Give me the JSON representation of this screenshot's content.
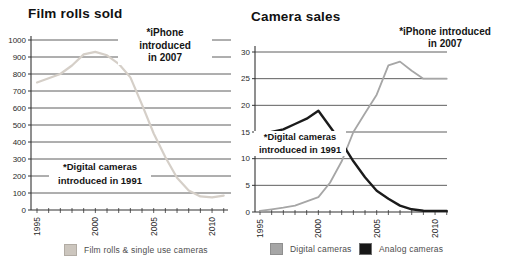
{
  "page": {
    "background": "#ffffff"
  },
  "chart_data": [
    {
      "type": "line",
      "title": "Film rolls sold",
      "x": [
        1995,
        1996,
        1997,
        1998,
        1999,
        2000,
        2001,
        2002,
        2003,
        2004,
        2005,
        2006,
        2007,
        2008,
        2009,
        2010,
        2011
      ],
      "x_tick_labels": [
        "1995",
        "2000",
        "2005",
        "2010"
      ],
      "x_labeled_years": [
        1995,
        2000,
        2005,
        2010
      ],
      "ylim": [
        0,
        1000
      ],
      "y_ticks": [
        0,
        100,
        200,
        300,
        400,
        500,
        600,
        700,
        800,
        900,
        1000
      ],
      "grid": "on",
      "series": [
        {
          "name": "Film rolls & single use cameras",
          "color": "#d5cfc8",
          "width": 2.2,
          "values": [
            750,
            775,
            800,
            850,
            915,
            930,
            910,
            860,
            780,
            620,
            450,
            310,
            190,
            115,
            80,
            75,
            85
          ]
        }
      ],
      "annotations": [
        {
          "lines": [
            "*iPhone",
            "introduced",
            "in 2007"
          ]
        },
        {
          "lines": [
            "*Digital cameras",
            "introduced in 1991"
          ]
        }
      ],
      "legend": [
        {
          "label": "Film rolls & single use cameras",
          "color": "#ccc6be",
          "border": "#b2aca4"
        }
      ],
      "legend_position": "bottom"
    },
    {
      "type": "line",
      "title": "Camera sales",
      "x": [
        1995,
        1996,
        1997,
        1998,
        1999,
        2000,
        2001,
        2002,
        2003,
        2004,
        2005,
        2006,
        2007,
        2008,
        2009,
        2010,
        2011
      ],
      "x_tick_labels": [
        "1995",
        "2000",
        "2005",
        "2010"
      ],
      "x_labeled_years": [
        1995,
        2000,
        2005,
        2010
      ],
      "ylim": [
        0,
        30
      ],
      "y_ticks": [
        0,
        5,
        10,
        15,
        20,
        25,
        30
      ],
      "grid": "on",
      "series": [
        {
          "name": "Digital cameras",
          "color": "#a6a6a6",
          "width": 1.8,
          "values": [
            0.2,
            0.5,
            0.8,
            1.2,
            2,
            2.8,
            5.5,
            9.5,
            15,
            18.5,
            22,
            27.5,
            28.2,
            26.5,
            25,
            25,
            25
          ]
        },
        {
          "name": "Analog cameras",
          "color": "#1b1b1b",
          "width": 2.4,
          "values": [
            14.5,
            15,
            15.5,
            16.5,
            17.5,
            19,
            16,
            13,
            9.5,
            6.5,
            4,
            2.5,
            1.2,
            0.5,
            0.25,
            0.2,
            0.2
          ]
        }
      ],
      "annotations": [
        {
          "lines": [
            "*iPhone introduced",
            "in 2007"
          ]
        },
        {
          "lines": [
            "*Digital cameras",
            "introduced in 1991"
          ]
        }
      ],
      "legend": [
        {
          "label": "Digital cameras",
          "color": "#a6a6a6",
          "border": "#8f8f8f"
        },
        {
          "label": "Analog cameras",
          "color": "#171717",
          "border": "#6e6e6e"
        }
      ],
      "legend_position": "bottom"
    }
  ],
  "style_colors": {
    "gridline": "#4d4d4d",
    "axis": "#333333",
    "tick_label": "#2a2a2a"
  }
}
